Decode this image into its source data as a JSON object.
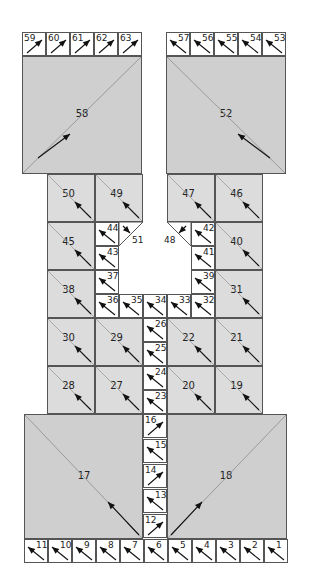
{
  "diagram": {
    "colors": {
      "big_fill": "#cfcfcf",
      "square_fill": "#dcdcdc",
      "small_fill": "#ffffff",
      "border": "#555555",
      "arrow": "#111111",
      "diagonal": "#9a9a9a"
    },
    "top_left_strip": [
      "59",
      "60",
      "61",
      "62",
      "63"
    ],
    "top_right_strip": [
      "57",
      "56",
      "55",
      "54",
      "53"
    ],
    "big_top_left": "58",
    "big_top_right": "52",
    "grid_left": [
      [
        "50",
        "49"
      ],
      [
        "45",
        ""
      ],
      [
        "38",
        ""
      ],
      [
        "30",
        "29"
      ],
      [
        "28",
        "27"
      ]
    ],
    "grid_right": [
      [
        "47",
        "46"
      ],
      [
        "",
        "40"
      ],
      [
        "",
        "31"
      ],
      [
        "22",
        "21"
      ],
      [
        "20",
        "19"
      ]
    ],
    "inner_left_column": [
      "44",
      "43",
      "37",
      "36"
    ],
    "inner_right_column": [
      "42",
      "41",
      "39",
      "32"
    ],
    "inner_bottom_row": [
      "36",
      "35",
      "34",
      "33",
      "32"
    ],
    "triangle_left": "51",
    "triangle_right": "48",
    "center_column_mid": [
      "26",
      "25",
      "24",
      "23"
    ],
    "center_column_bottom": [
      "16",
      "15",
      "14",
      "13",
      "12"
    ],
    "big_bottom_left": "17",
    "big_bottom_right": "18",
    "bottom_strip": [
      "11",
      "10",
      "9",
      "8",
      "7",
      "6",
      "5",
      "4",
      "3",
      "2",
      "1"
    ]
  }
}
